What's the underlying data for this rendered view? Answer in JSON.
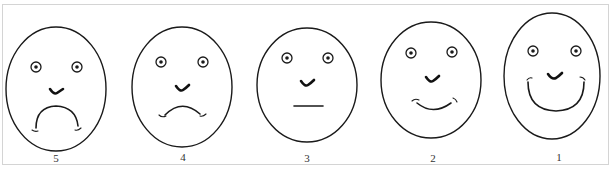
{
  "figure": {
    "type": "facial-expression pain/mood rating scale",
    "faces": [
      {
        "label": "5",
        "expression": "very sad (strong frown)"
      },
      {
        "label": "4",
        "expression": "sad (slight frown)"
      },
      {
        "label": "3",
        "expression": "neutral (flat mouth)"
      },
      {
        "label": "2",
        "expression": "happy (slight smile)"
      },
      {
        "label": "1",
        "expression": "very happy (big smile)"
      }
    ]
  },
  "colors": {
    "line": "#1a1a1a",
    "frame": "#d4d4d4",
    "background": "#ffffff"
  }
}
